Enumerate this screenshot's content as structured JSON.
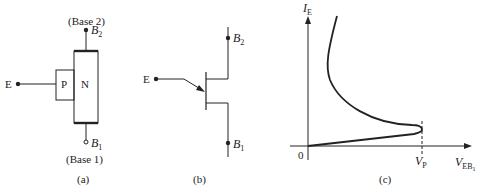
{
  "panel_a": {
    "caption": "(a)",
    "base2_label": "(Base 2)",
    "base1_label": "(Base 1)",
    "b2_terminal": "B",
    "b2_sub": "2",
    "b1_terminal": "B",
    "b1_sub": "1",
    "emitter_terminal": "E",
    "p_region": "P",
    "n_region": "N"
  },
  "panel_b": {
    "caption": "(b)",
    "emitter_terminal": "E",
    "b2_terminal": "B",
    "b2_sub": "2",
    "b1_terminal": "B",
    "b1_sub": "1"
  },
  "panel_c": {
    "caption": "(c)",
    "y_axis_label": "I",
    "y_axis_sub": "E",
    "x_axis_label": "V",
    "x_axis_sub": "EB",
    "x_axis_subsub": "1",
    "origin_label": "0",
    "peak_label": "V",
    "peak_sub": "P"
  },
  "colors": {
    "ink": "#222222",
    "background": "#ffffff"
  }
}
